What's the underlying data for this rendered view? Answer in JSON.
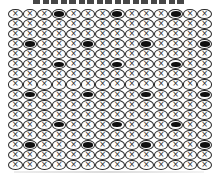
{
  "figure": {
    "background_color": "#ffffff",
    "ink_color": "#1f1f1f",
    "top_clipped_text": {
      "present": true,
      "note": ""
    },
    "grid": {
      "columns": 14,
      "rows": 16,
      "symbol": "×",
      "symbol_site_name": "circle-x-symbol",
      "filled_site_name": "filled-ellipse-symbol",
      "filled_cells": [
        [
          1,
          4
        ],
        [
          1,
          8
        ],
        [
          1,
          12
        ],
        [
          4,
          2
        ],
        [
          4,
          6
        ],
        [
          4,
          10
        ],
        [
          4,
          14
        ],
        [
          6,
          4
        ],
        [
          6,
          8
        ],
        [
          6,
          12
        ],
        [
          9,
          2
        ],
        [
          9,
          6
        ],
        [
          9,
          10
        ],
        [
          9,
          14
        ],
        [
          12,
          4
        ],
        [
          12,
          8
        ],
        [
          12,
          12
        ],
        [
          14,
          2
        ],
        [
          14,
          6
        ],
        [
          14,
          10
        ],
        [
          14,
          14
        ]
      ]
    }
  }
}
